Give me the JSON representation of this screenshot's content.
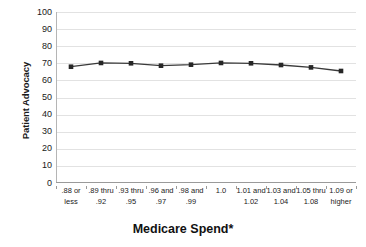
{
  "chart_data": {
    "type": "line",
    "title": "",
    "subtitle": "",
    "xlabel": "Medicare Spend*",
    "ylabel": "Patient Advocacy",
    "categories": [
      ".88 or less",
      ".89 thru .92",
      ".93 thru .95",
      ".96 and .97",
      ".98 and .99",
      "1.0",
      "1.01 and 1.02",
      "1.03 and 1.04",
      "1.05 thru 1.08",
      "1.09 or higher"
    ],
    "category_lines": [
      [
        ".88 or",
        "less"
      ],
      [
        ".89 thru",
        ".92"
      ],
      [
        ".93 thru",
        ".95"
      ],
      [
        ".96 and",
        ".97"
      ],
      [
        ".98 and",
        ".99"
      ],
      [
        "1.0",
        ""
      ],
      [
        "1.01 and",
        "1.02"
      ],
      [
        "1.03 and",
        "1.04"
      ],
      [
        "1.05 thru",
        "1.08"
      ],
      [
        "1.09 or",
        "higher"
      ]
    ],
    "series": [
      {
        "name": "Patient Advocacy",
        "values": [
          68.0,
          70.2,
          70.0,
          68.6,
          69.2,
          70.2,
          70.0,
          69.0,
          67.6,
          65.5
        ]
      }
    ],
    "ylim": [
      0,
      100
    ],
    "ytick_values": [
      100,
      90,
      80,
      70,
      60,
      50,
      40,
      30,
      20,
      10,
      0
    ],
    "ytick_labels": [
      "100",
      "90",
      "80",
      "70",
      "60",
      "50",
      "40",
      "30",
      "20",
      "10",
      "0"
    ],
    "grid": true,
    "grid_axis": "y",
    "legend": false,
    "legend_position": "none",
    "colors": {
      "line": "#3a3a3a",
      "marker": "#262626",
      "gridline": "#e2e2e2",
      "axis": "#9a9a9a",
      "text": "#1a1a1a",
      "background": "#ffffff"
    },
    "marker_style": "square",
    "annotations": []
  }
}
